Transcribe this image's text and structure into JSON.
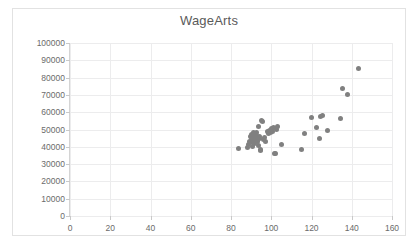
{
  "chart": {
    "title": "WageArts",
    "marker_color": "#808080",
    "grid_color": "#ececed",
    "axis_color": "#d4d4d4",
    "tick_label_color": "#6b6b6b",
    "title_color": "#5a5a5a"
  },
  "chart_data": {
    "type": "scatter",
    "title": "WageArts",
    "xlabel": "",
    "ylabel": "",
    "xlim": [
      0,
      160
    ],
    "ylim": [
      0,
      100000
    ],
    "xticks": [
      0,
      20,
      40,
      60,
      80,
      100,
      120,
      140,
      160
    ],
    "yticks": [
      0,
      10000,
      20000,
      30000,
      40000,
      50000,
      60000,
      70000,
      80000,
      90000,
      100000
    ],
    "grid": true,
    "legend": false,
    "series": [
      {
        "name": "WageArts",
        "color": "#808080",
        "points": [
          [
            83.5,
            39200
          ],
          [
            88.0,
            39800
          ],
          [
            88.6,
            41500
          ],
          [
            89.2,
            43000
          ],
          [
            89.5,
            46000
          ],
          [
            90.0,
            47300
          ],
          [
            90.3,
            44500
          ],
          [
            90.6,
            42200
          ],
          [
            90.8,
            40200
          ],
          [
            91.0,
            48000
          ],
          [
            91.3,
            46500
          ],
          [
            91.5,
            45000
          ],
          [
            91.7,
            43400
          ],
          [
            91.9,
            41800
          ],
          [
            92.1,
            47000
          ],
          [
            92.4,
            44000
          ],
          [
            92.6,
            46800
          ],
          [
            92.8,
            48500
          ],
          [
            93.0,
            45600
          ],
          [
            93.2,
            43000
          ],
          [
            93.5,
            41000
          ],
          [
            93.8,
            52000
          ],
          [
            94.0,
            46200
          ],
          [
            94.3,
            44800
          ],
          [
            94.6,
            38400
          ],
          [
            94.9,
            38100
          ],
          [
            95.2,
            55200
          ],
          [
            95.6,
            54600
          ],
          [
            96.0,
            44000
          ],
          [
            96.4,
            45400
          ],
          [
            97.0,
            43200
          ],
          [
            98.0,
            48800
          ],
          [
            98.6,
            47500
          ],
          [
            99.2,
            49600
          ],
          [
            99.8,
            48200
          ],
          [
            100.2,
            50400
          ],
          [
            100.6,
            49000
          ],
          [
            101.0,
            51400
          ],
          [
            101.4,
            36400
          ],
          [
            102.0,
            36200
          ],
          [
            102.6,
            50000
          ],
          [
            103.2,
            51800
          ],
          [
            105.2,
            41600
          ],
          [
            115.0,
            38200
          ],
          [
            116.4,
            47400
          ],
          [
            119.8,
            56900
          ],
          [
            122.4,
            51000
          ],
          [
            124.0,
            44900
          ],
          [
            124.4,
            57300
          ],
          [
            125.4,
            58100
          ],
          [
            128.0,
            49600
          ],
          [
            134.6,
            56400
          ],
          [
            135.4,
            73600
          ],
          [
            138.0,
            70100
          ],
          [
            143.4,
            85500
          ]
        ]
      }
    ]
  }
}
